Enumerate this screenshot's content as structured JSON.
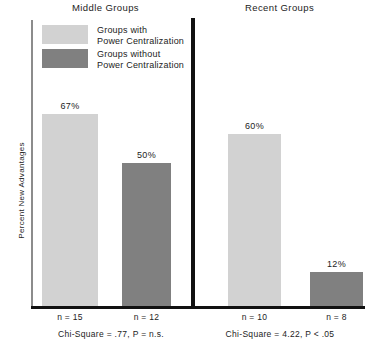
{
  "chart_data": {
    "type": "bar",
    "title": "",
    "xlabel": "",
    "ylabel": "Percent New Advantages",
    "ylim": [
      0,
      100
    ],
    "grid": false,
    "legend_position": "top-left",
    "panels": [
      {
        "name": "Middle Groups",
        "categories": [
          "n = 15",
          "n = 12"
        ],
        "values": [
          67,
          12
        ],
        "statistic": "Chi-Square = .77, P = n.s."
      },
      {
        "name": "Recent Groups",
        "categories": [
          "n = 10",
          "n = 8"
        ],
        "values": [
          60,
          12
        ],
        "statistic": "Chi-Square = 4.22, P < .05"
      }
    ],
    "series": [
      {
        "name": "Groups with Power Centralization",
        "values": [
          67,
          60
        ],
        "color": "#d2d2d2"
      },
      {
        "name": "Groups without Power Centralization",
        "values": [
          50,
          12
        ],
        "color": "#808080"
      }
    ],
    "bars": [
      {
        "panel": "Middle Groups",
        "series": "Groups with Power Centralization",
        "value": 67,
        "value_label": "67%",
        "n_label": "n = 15",
        "color": "#d2d2d2"
      },
      {
        "panel": "Middle Groups",
        "series": "Groups without Power Centralization",
        "value": 50,
        "value_label": "50%",
        "n_label": "n = 12",
        "color": "#808080"
      },
      {
        "panel": "Recent Groups",
        "series": "Groups with Power Centralization",
        "value": 60,
        "value_label": "60%",
        "n_label": "n = 10",
        "color": "#d2d2d2"
      },
      {
        "panel": "Recent Groups",
        "series": "Groups without Power Centralization",
        "value": 12,
        "value_label": "12%",
        "n_label": "n = 8",
        "color": "#808080"
      }
    ]
  },
  "panels": {
    "left_title": "Middle Groups",
    "right_title": "Recent Groups"
  },
  "axis": {
    "y_label": "Percent New Advantages"
  },
  "legend": {
    "items": [
      {
        "label": "Groups with\nPower Centralization",
        "color": "#d2d2d2"
      },
      {
        "label": "Groups without\nPower Centralization",
        "color": "#808080"
      }
    ]
  },
  "values": {
    "bar1": "67%",
    "bar2": "50%",
    "bar3": "60%",
    "bar4": "12%"
  },
  "n_labels": {
    "bar1": "n = 15",
    "bar2": "n = 12",
    "bar3": "n = 10",
    "bar4": "n = 8"
  },
  "stats": {
    "left": "Chi-Square = .77, P = n.s.",
    "right": "Chi-Square = 4.22, P < .05"
  }
}
